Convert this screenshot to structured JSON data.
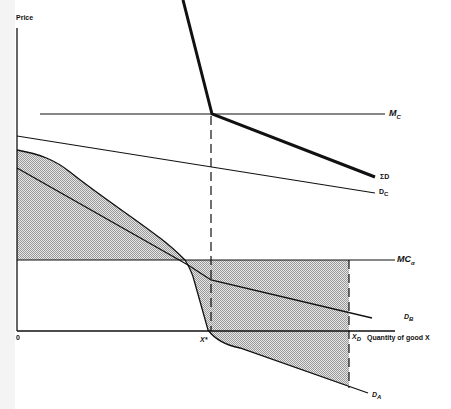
{
  "diagram": {
    "axes": {
      "y_label": "Price",
      "x_label": "Quantity of good X",
      "origin_label": "0"
    },
    "curves": {
      "mc": {
        "label": "M",
        "sub": "C"
      },
      "sum_d": {
        "label": "ΣD"
      },
      "d_c": {
        "label": "D",
        "sub": "C"
      },
      "mc_alpha": {
        "label": "MC",
        "sub": "α"
      },
      "d_b": {
        "label": "D",
        "sub": "B"
      },
      "d_a": {
        "label": "D",
        "sub": "A"
      }
    },
    "markers": {
      "x_star": "X*",
      "x_d": {
        "label": "X",
        "sub": "D"
      }
    },
    "colors": {
      "line": "#111111",
      "shade": "#c8c8c8",
      "background": "#ffffff"
    }
  }
}
